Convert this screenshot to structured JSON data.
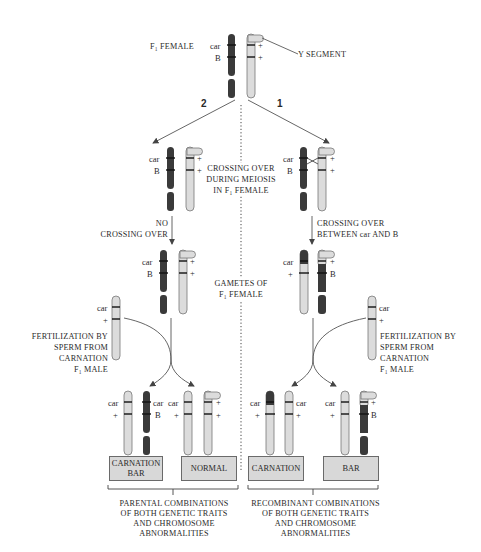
{
  "title_labels": {
    "f1_female": "F₁ FEMALE",
    "y_segment": "Y SEGMENT"
  },
  "pathways": {
    "left_number": "2",
    "right_number": "1"
  },
  "center_labels": {
    "crossing_over_meiosis": [
      "CROSSING OVER",
      "DURING MEIOSIS",
      "IN F₁ FEMALE"
    ],
    "gametes": [
      "GAMETES OF",
      "F₁ FEMALE"
    ]
  },
  "left_path": {
    "step_label": [
      "NO",
      "CROSSING OVER"
    ],
    "fertilization": [
      "FERTILIZATION BY",
      "SPERM FROM",
      "CARNATION",
      "F₁ MALE"
    ]
  },
  "right_path": {
    "step_label": [
      "CROSSING OVER",
      "BETWEEN car AND B"
    ],
    "fertilization": [
      "FERTILIZATION BY",
      "SPERM FROM",
      "CARNATION",
      "F₁ MALE"
    ]
  },
  "gene_labels": {
    "car": "car",
    "B": "B",
    "plus": "+"
  },
  "phenotype_boxes": [
    {
      "label": [
        "CARNATION",
        "BAR"
      ]
    },
    {
      "label": [
        "NORMAL"
      ]
    },
    {
      "label": [
        "CARNATION"
      ]
    },
    {
      "label": [
        "BAR"
      ]
    }
  ],
  "group_captions": {
    "parental": [
      "PARENTAL COMBINATIONS",
      "OF BOTH GENETIC TRAITS",
      "AND CHROMOSOME",
      "ABNORMALITIES"
    ],
    "recombinant": [
      "RECOMBINANT COMBINATIONS",
      "OF BOTH GENETIC TRAITS",
      "AND CHROMOSOME",
      "ABNORMALITIES"
    ]
  },
  "colors": {
    "dark_chromosome": "#3a3a3a",
    "light_chromosome": "#dcdcdc",
    "box_fill": "#d8d8d8",
    "line": "#555555"
  }
}
